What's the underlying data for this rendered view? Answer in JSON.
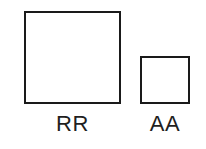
{
  "diagram": {
    "type": "size-comparison",
    "background_color": "#ffffff",
    "stroke_color": "#1a1a1a",
    "fill_color": "#ffffff",
    "label_color": "#1f1f1f",
    "shapes": [
      {
        "id": "large",
        "shape": "square",
        "label": "RR"
      },
      {
        "id": "small",
        "shape": "square",
        "label": "AA"
      }
    ]
  }
}
